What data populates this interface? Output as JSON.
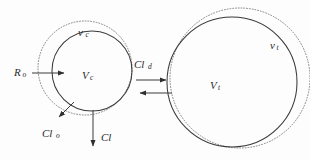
{
  "diagram": {
    "background_color": "#fdfdfd",
    "stroke_color": "#3a3a3a",
    "dotted_stroke_color": "#7d7d7d",
    "label_color": "#2b2b2b"
  },
  "central_compartment": {
    "name": "central-compartment",
    "outer_label": {
      "base": "v",
      "subscript": "c",
      "x": 78,
      "y": 33
    },
    "inner_label": {
      "base": "V",
      "subscript": "c",
      "x": 82,
      "y": 76
    },
    "dotted_circle": {
      "cx": 85,
      "cy": 68,
      "r": 47
    },
    "solid_circle": {
      "cx": 92,
      "cy": 71,
      "r": 40
    }
  },
  "tissue_compartment": {
    "name": "tissue-compartment",
    "outer_label": {
      "base": "v",
      "subscript": "t",
      "x": 270,
      "y": 46
    },
    "inner_label": {
      "base": "V",
      "subscript": "t",
      "x": 210,
      "y": 86
    },
    "dotted_circle": {
      "cx": 240,
      "cy": 78,
      "r": 70
    },
    "solid_circle": {
      "cx": 232,
      "cy": 82,
      "r": 65
    }
  },
  "arrows": {
    "input": {
      "name": "input-arrow",
      "label": {
        "base": "R",
        "subscript": "o",
        "x": 17,
        "y": 73
      },
      "x1": 32,
      "y1": 73,
      "x2": 68,
      "y2": 73
    },
    "distribution_forward": {
      "name": "distribution-forward-arrow",
      "label": {
        "base": "Cl",
        "subscript": "d",
        "x": 136,
        "y": 65
      },
      "x1": 136,
      "y1": 80,
      "x2": 170,
      "y2": 80
    },
    "distribution_reverse": {
      "name": "distribution-reverse-arrow",
      "label": null,
      "x1": 172,
      "y1": 93,
      "x2": 136,
      "y2": 93
    },
    "organ_clearance": {
      "name": "organ-clearance-arrow",
      "label": {
        "base": "Cl",
        "subscript": "o",
        "x": 47,
        "y": 134
      },
      "x1": 72,
      "y1": 104,
      "x2": 57,
      "y2": 120
    },
    "total_clearance": {
      "name": "total-clearance-arrow",
      "label": {
        "base": "Cl",
        "subscript": "",
        "x": 104,
        "y": 138
      },
      "x1": 93,
      "y1": 110,
      "x2": 93,
      "y2": 150
    }
  }
}
